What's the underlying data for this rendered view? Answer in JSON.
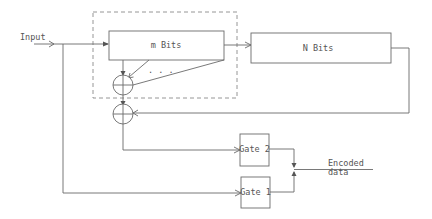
{
  "diagram": {
    "type": "block-diagram",
    "labels": {
      "input": "Input",
      "m_bits": "m Bits",
      "n_bits": "N Bits",
      "gate2": "Gate 2",
      "gate1": "Gate 1",
      "encoded_line1": "Encoded",
      "encoded_line2": "data",
      "dots": ". . ."
    },
    "nodes": [
      {
        "id": "m_bits",
        "label": "m Bits",
        "kind": "register"
      },
      {
        "id": "n_bits",
        "label": "N Bits",
        "kind": "register"
      },
      {
        "id": "xor1",
        "label": "",
        "kind": "xor"
      },
      {
        "id": "xor2",
        "label": "",
        "kind": "xor"
      },
      {
        "id": "gate2",
        "label": "Gate 2",
        "kind": "gate"
      },
      {
        "id": "gate1",
        "label": "Gate 1",
        "kind": "gate"
      }
    ],
    "edges": [
      {
        "from": "input",
        "to": "m_bits"
      },
      {
        "from": "m_bits",
        "to": "n_bits"
      },
      {
        "from": "m_bits",
        "to": "xor1"
      },
      {
        "from": "xor1",
        "to": "xor2"
      },
      {
        "from": "n_bits",
        "to": "xor2",
        "kind": "feedback"
      },
      {
        "from": "xor2",
        "to": "gate2"
      },
      {
        "from": "input",
        "to": "gate1"
      },
      {
        "from": "gate2",
        "to": "encoded_data"
      },
      {
        "from": "gate1",
        "to": "encoded_data"
      }
    ],
    "groups": [
      {
        "id": "dashed-group",
        "contains": [
          "m_bits",
          "xor1"
        ],
        "style": "dashed"
      }
    ]
  }
}
